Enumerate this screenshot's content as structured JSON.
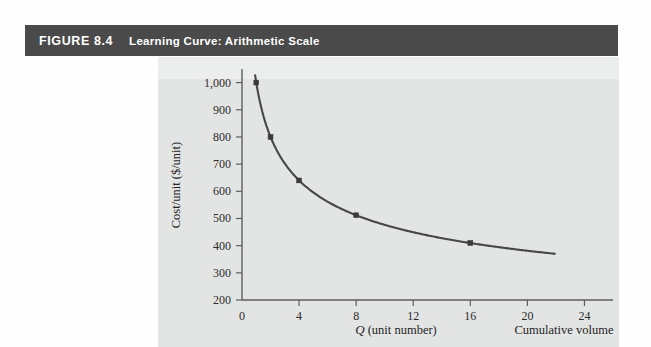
{
  "header": {
    "figure_number": "FIGURE 8.4",
    "title": "Learning Curve: Arithmetic Scale",
    "bar_color": "#4a4a4a",
    "text_color": "#ffffff"
  },
  "panel": {
    "background_color": "#e3e4e4"
  },
  "chart_data": {
    "type": "line",
    "title": "Learning Curve: Arithmetic Scale",
    "xlabel": "Q (unit number)",
    "xlabel_secondary": "Cumulative volume",
    "ylabel": "Cost/unit ($/unit)",
    "xlim": [
      0,
      26
    ],
    "ylim": [
      200,
      1050
    ],
    "xticks": [
      0,
      4,
      8,
      12,
      16,
      20,
      24
    ],
    "xtick_labels": [
      "0",
      "4",
      "8",
      "12",
      "16",
      "20",
      "24"
    ],
    "yticks": [
      200,
      300,
      400,
      500,
      600,
      700,
      800,
      900,
      1000
    ],
    "ytick_labels": [
      "200",
      "300",
      "400",
      "500",
      "600",
      "700",
      "800",
      "900",
      "1,000"
    ],
    "grid": false,
    "legend": false,
    "learning_rate": 0.8,
    "series": [
      {
        "name": "Cost per unit",
        "color": "#474747",
        "marker": "square",
        "x": [
          1,
          2,
          4,
          8,
          16
        ],
        "values": [
          1000,
          800,
          640,
          512,
          410
        ]
      }
    ],
    "curve_note": "Smooth 80% learning curve extending from Q=0.6 to Q=22"
  }
}
